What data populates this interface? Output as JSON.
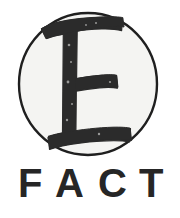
{
  "logo": {
    "name": "FACT logo",
    "wordmark": "FACT",
    "wordmark_letters": [
      "F",
      "A",
      "C",
      "T"
    ],
    "emblem_letter": "E",
    "emblem_shape": "circle",
    "colors": {
      "ink": "#262626",
      "ink_soft": "#2f2f2f",
      "background": "#ffffff",
      "disc_fill": "#f4f4f2",
      "outline": "#1f1f1f"
    },
    "geometry": {
      "circle_center_x": 88,
      "circle_center_y": 84,
      "circle_radius_x": 70,
      "circle_radius_y": 72,
      "outline_width": 2
    },
    "wordmark_tracking": "wide"
  }
}
